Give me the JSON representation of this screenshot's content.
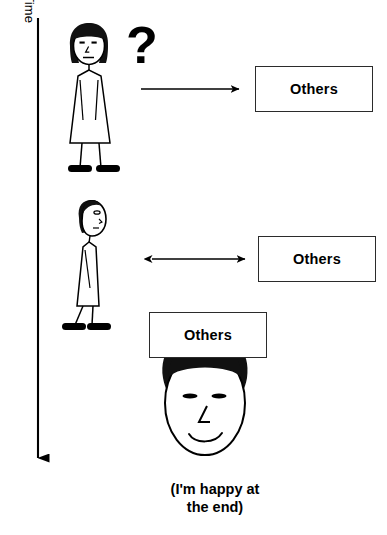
{
  "diagram": {
    "title_axis": "Time",
    "question_mark": "?",
    "caption_line1": "(I'm happy at",
    "caption_line2": "the end)",
    "colors": {
      "ink": "#000000",
      "box_stroke": "#2b2b2b",
      "background": "#ffffff",
      "hair": "#111111"
    },
    "boxes": [
      {
        "label": "Others",
        "stage": 1
      },
      {
        "label": "Others",
        "stage": 2
      },
      {
        "label": "Others",
        "stage": 3
      }
    ],
    "arrows": [
      {
        "stage": 1,
        "direction": "right",
        "heads": 1
      },
      {
        "stage": 2,
        "direction": "both",
        "heads": 2
      },
      {
        "stage": "time",
        "direction": "down",
        "heads": 1
      }
    ],
    "figures": [
      {
        "stage": 1,
        "view": "front",
        "expression": "neutral",
        "pose": "standing"
      },
      {
        "stage": 2,
        "view": "profile",
        "expression": "neutral",
        "pose": "standing-side"
      },
      {
        "stage": 3,
        "view": "face-closeup",
        "expression": "smiling",
        "pose": "head-only"
      }
    ]
  }
}
